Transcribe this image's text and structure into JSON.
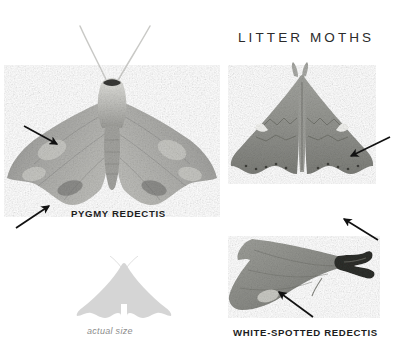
{
  "plate": {
    "title": "LITTER MOTHS",
    "background_color": "#ffffff",
    "width": 398,
    "height": 358
  },
  "specimens": [
    {
      "id": "pygmy-redectis",
      "label": "PYGMY REDECTIS",
      "view": "dorsal-spread",
      "description": "Grayish mottled moth with broad spread wings and long slender antennae",
      "body_color": "#a8a8a6",
      "arrow_count": 2
    },
    {
      "id": "white-spotted-redectis",
      "label": "WHITE-SPOTTED REDECTIS",
      "view": "dorsal-spread",
      "description": "Triangular dark gray moth with paired white wing spots",
      "body_color": "#8f908c",
      "arrow_count": 1
    },
    {
      "id": "white-spotted-redectis-lateral",
      "label": "",
      "view": "lateral",
      "description": "Side view of moth with dark tufted abdomen tip",
      "body_color": "#90918d",
      "arrow_count": 2
    }
  ],
  "size_reference": {
    "caption": "actual size",
    "silhouette_color": "#d5d5d5",
    "caption_color": "#8d8d8d"
  },
  "annotations": {
    "arrow_color": "#111111",
    "arrows": [
      {
        "name": "arrow-pygmy-forewing-spot",
        "x1": 24,
        "y1": 126,
        "x2": 57,
        "y2": 144
      },
      {
        "name": "arrow-pygmy-hindwing-margin",
        "x1": 16,
        "y1": 228,
        "x2": 49,
        "y2": 206
      },
      {
        "name": "arrow-white-spot-right-wing",
        "x1": 390,
        "y1": 137,
        "x2": 351,
        "y2": 156
      },
      {
        "name": "arrow-lateral-upper",
        "x1": 378,
        "y1": 240,
        "x2": 344,
        "y2": 219
      },
      {
        "name": "arrow-lateral-lower",
        "x1": 313,
        "y1": 317,
        "x2": 279,
        "y2": 292
      }
    ]
  }
}
